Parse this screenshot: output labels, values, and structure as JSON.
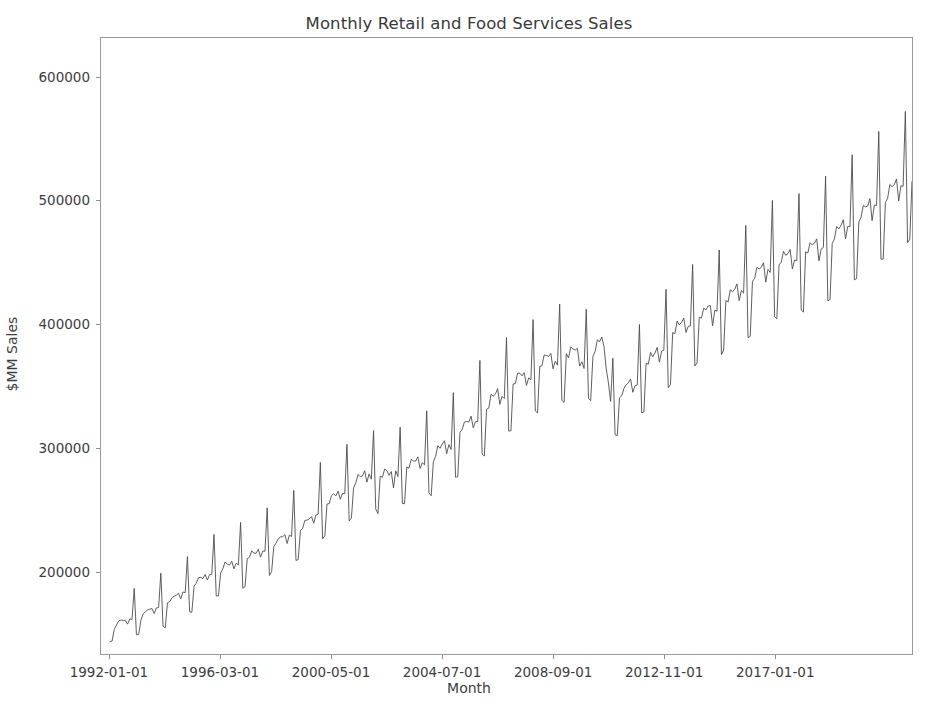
{
  "chart_data": {
    "type": "line",
    "title": "Monthly Retail and Food Services Sales",
    "xlabel": "Month",
    "ylabel": "$MM Sales",
    "grid": false,
    "legend": null,
    "line_color": "#4d4d4d",
    "line_width": 0.9,
    "xtick_labels": [
      "1992-01-01",
      "1996-03-01",
      "2000-05-01",
      "2004-07-01",
      "2008-09-01",
      "2012-11-01",
      "2017-01-01"
    ],
    "xtick_indices": [
      0,
      50,
      100,
      150,
      200,
      250,
      300
    ],
    "ytick_labels": [
      "200000",
      "300000",
      "400000",
      "500000",
      "600000"
    ],
    "ytick_values": [
      200000,
      300000,
      400000,
      500000,
      600000
    ],
    "ylim": [
      133000,
      632000
    ],
    "xlim": [
      -4,
      362
    ],
    "x_start": "1992-01-01",
    "x_end": "2021-05-01",
    "x_frequency": "monthly",
    "n_points": 353,
    "series_name": "Retail and Food Services Sales",
    "values": [
      142900,
      143500,
      153000,
      156600,
      159800,
      160500,
      160300,
      160100,
      157200,
      161400,
      161000,
      186200,
      148600,
      148800,
      160300,
      165400,
      167200,
      168700,
      169300,
      169800,
      165800,
      170300,
      170600,
      198400,
      155400,
      154200,
      174500,
      175300,
      178600,
      179800,
      180600,
      182100,
      177600,
      183200,
      182700,
      211900,
      167200,
      166800,
      188000,
      190400,
      194800,
      195200,
      194000,
      197500,
      192900,
      197200,
      197600,
      229900,
      180100,
      180000,
      198600,
      202100,
      207600,
      205700,
      205000,
      208200,
      202000,
      206500,
      205300,
      239600,
      186300,
      187500,
      210300,
      211400,
      216500,
      214800,
      214500,
      217900,
      211500,
      216300,
      216300,
      251400,
      196600,
      199800,
      220100,
      222900,
      226300,
      227900,
      228000,
      229700,
      222500,
      229300,
      228200,
      265600,
      208800,
      209500,
      233200,
      234800,
      241200,
      241500,
      242400,
      244300,
      238900,
      245600,
      246200,
      288200,
      226300,
      228700,
      254400,
      254900,
      261200,
      262700,
      261100,
      264900,
      258400,
      263100,
      262800,
      302800,
      240800,
      243000,
      267600,
      271800,
      278400,
      276600,
      277300,
      281500,
      272200,
      278900,
      274600,
      314000,
      250400,
      246700,
      277200,
      276100,
      282800,
      281600,
      277700,
      280800,
      267500,
      281400,
      276800,
      316700,
      254800,
      254900,
      284500,
      283500,
      290700,
      289400,
      289300,
      292700,
      283300,
      288000,
      286300,
      330000,
      263500,
      261200,
      288700,
      293000,
      301700,
      299600,
      303100,
      305800,
      295300,
      302600,
      298700,
      344700,
      276200,
      276500,
      312400,
      315000,
      320900,
      321400,
      320900,
      325700,
      316200,
      321200,
      321400,
      370800,
      294900,
      293400,
      331300,
      332200,
      343300,
      341900,
      343500,
      348000,
      335200,
      341700,
      339900,
      389400,
      313600,
      313800,
      351700,
      352100,
      360500,
      360500,
      358300,
      360900,
      350600,
      356600,
      355200,
      403900,
      329900,
      328300,
      365900,
      366500,
      375200,
      374900,
      374000,
      376500,
      364000,
      370200,
      367000,
      416500,
      338400,
      336800,
      376300,
      372900,
      381800,
      380100,
      379200,
      380600,
      366200,
      369700,
      364300,
      412300,
      340100,
      338200,
      374000,
      378200,
      387400,
      386000,
      389800,
      382100,
      364100,
      352700,
      337600,
      372600,
      310600,
      309900,
      340500,
      342200,
      348100,
      351100,
      352600,
      355700,
      345000,
      350300,
      350800,
      399900,
      328400,
      329100,
      368400,
      367700,
      377200,
      373700,
      376800,
      381300,
      369400,
      378400,
      379100,
      428400,
      348700,
      351400,
      393400,
      392500,
      402700,
      399600,
      401700,
      405000,
      393400,
      398400,
      398900,
      448600,
      366300,
      368900,
      405800,
      405200,
      413100,
      411700,
      414900,
      415300,
      398900,
      411500,
      410700,
      460300,
      375500,
      379200,
      419300,
      418200,
      428100,
      426400,
      428600,
      432800,
      419200,
      427500,
      425300,
      480200,
      389300,
      390300,
      434900,
      437300,
      446300,
      444900,
      446200,
      450000,
      434200,
      444500,
      442100,
      500400,
      406200,
      404500,
      448200,
      450400,
      459200,
      456000,
      457300,
      460700,
      444900,
      452200,
      451400,
      506000,
      411700,
      410000,
      458700,
      457900,
      466200,
      464400,
      465900,
      469300,
      451500,
      461100,
      462300,
      520100,
      419200,
      420100,
      465500,
      469300,
      479400,
      477400,
      480300,
      484800,
      469200,
      479400,
      479200,
      537400,
      436100,
      437100,
      482900,
      486700,
      496300,
      495200,
      495800,
      501900,
      484000,
      496600,
      496300,
      556300,
      452800,
      452900,
      498700,
      502100,
      513300,
      511600,
      513200,
      517800,
      500000,
      512300,
      511900,
      572500,
      466200,
      469100,
      516100,
      517700,
      526900,
      525600,
      528200,
      533200,
      514500,
      527500,
      528200,
      586800,
      483900,
      477800,
      460600,
      406500,
      452800,
      506600,
      517100,
      518000,
      523400,
      528100,
      520700,
      589300,
      538400,
      549700,
      608200,
      550100,
      552500
    ]
  }
}
